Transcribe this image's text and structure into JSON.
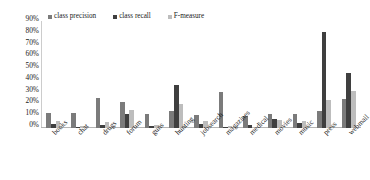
{
  "chart_data": {
    "type": "bar",
    "title": "",
    "xlabel": "",
    "ylabel": "",
    "ylim": [
      0,
      90
    ],
    "grid": false,
    "legend_position": "top-left",
    "categories": [
      "books",
      "chat",
      "drugs",
      "forum",
      "guns",
      "hunting",
      "jobsearch",
      "magazines",
      "medical",
      "movies",
      "music",
      "press",
      "webmail"
    ],
    "ytick_labels": [
      "90%",
      "80%",
      "70%",
      "60%",
      "50%",
      "40%",
      "30%",
      "20%",
      "10%",
      "0%"
    ],
    "ytick_values": [
      90,
      80,
      70,
      60,
      50,
      40,
      30,
      20,
      10,
      0
    ],
    "series": [
      {
        "name": "class precision",
        "color": "#7b7b7b",
        "values": [
          12.5,
          12.5,
          25.0,
          22.0,
          12.0,
          14.0,
          11.0,
          30.0,
          10.0,
          11.5,
          12.0,
          14.0,
          24.5
        ]
      },
      {
        "name": "class recall",
        "color": "#3f3f3f",
        "values": [
          3.5,
          1.0,
          2.5,
          12.0,
          1.5,
          36.5,
          3.5,
          1.0,
          2.5,
          7.5,
          4.0,
          81.0,
          46.0
        ]
      },
      {
        "name": "F-measure",
        "color": "#bdbdbd",
        "values": [
          5.5,
          1.5,
          5.0,
          15.5,
          2.5,
          20.5,
          5.5,
          1.5,
          1.0,
          6.5,
          6.0,
          23.5,
          31.5
        ]
      }
    ]
  },
  "legend": {
    "items": [
      {
        "label": "class precision",
        "color": "#7b7b7b"
      },
      {
        "label": "class recall",
        "color": "#3f3f3f"
      },
      {
        "label": "F-measure",
        "color": "#bdbdbd"
      }
    ]
  }
}
